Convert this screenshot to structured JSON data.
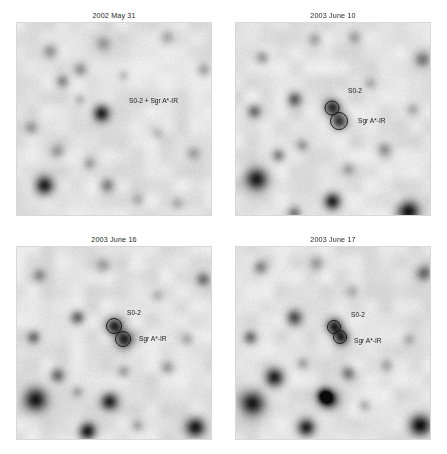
{
  "figure": {
    "name": "galactic-center-ir-epochs",
    "rows": 2,
    "columns": 2,
    "background_color": "#ffffff",
    "title_color": "#231f20",
    "label_color": "#1a1a1a",
    "frame_color": "#d8d8d8"
  },
  "panels": [
    {
      "id": "panel-1",
      "title": "2002 May 31",
      "labels": [
        {
          "text": "S0-2 + Sgr A*-IR",
          "x": 112,
          "y": 80
        }
      ],
      "markers": [],
      "sources": [
        {
          "x": 84,
          "y": 90,
          "r": 9.5,
          "depth": 0.88
        },
        {
          "x": 27,
          "y": 162,
          "r": 10.5,
          "depth": 0.92
        },
        {
          "x": 45,
          "y": 58,
          "r": 7.5,
          "depth": 0.4
        },
        {
          "x": 63,
          "y": 46,
          "r": 8.0,
          "depth": 0.34
        },
        {
          "x": 33,
          "y": 28,
          "r": 8.5,
          "depth": 0.33
        },
        {
          "x": 86,
          "y": 20,
          "r": 9.0,
          "depth": 0.3
        },
        {
          "x": 150,
          "y": 14,
          "r": 8.0,
          "depth": 0.26
        },
        {
          "x": 14,
          "y": 104,
          "r": 8.0,
          "depth": 0.36
        },
        {
          "x": 40,
          "y": 128,
          "r": 8.5,
          "depth": 0.34
        },
        {
          "x": 72,
          "y": 140,
          "r": 7.0,
          "depth": 0.26
        },
        {
          "x": 90,
          "y": 162,
          "r": 8.0,
          "depth": 0.36
        },
        {
          "x": 120,
          "y": 176,
          "r": 8.0,
          "depth": 0.28
        },
        {
          "x": 176,
          "y": 130,
          "r": 7.5,
          "depth": 0.24
        },
        {
          "x": 186,
          "y": 46,
          "r": 8.0,
          "depth": 0.3
        },
        {
          "x": 140,
          "y": 110,
          "r": 7.0,
          "depth": 0.18
        },
        {
          "x": 62,
          "y": 76,
          "r": 6.5,
          "depth": 0.22
        },
        {
          "x": 106,
          "y": 52,
          "r": 6.0,
          "depth": 0.16
        },
        {
          "x": 160,
          "y": 180,
          "r": 7.0,
          "depth": 0.2
        }
      ]
    },
    {
      "id": "panel-2",
      "title": "2003 June 10",
      "labels": [
        {
          "text": "S0-2",
          "x": 112,
          "y": 70
        },
        {
          "text": "Sgr A*-IR",
          "x": 122,
          "y": 100
        }
      ],
      "markers": [
        {
          "name": "S0-2",
          "x": 96,
          "y": 85,
          "r": 7
        },
        {
          "name": "Sgr A*-IR",
          "x": 103,
          "y": 98,
          "r": 8.5
        }
      ],
      "sources": [
        {
          "x": 96,
          "y": 84,
          "r": 9.0,
          "depth": 0.85
        },
        {
          "x": 103,
          "y": 98,
          "r": 9.0,
          "depth": 0.8
        },
        {
          "x": 20,
          "y": 156,
          "r": 13.0,
          "depth": 0.95
        },
        {
          "x": 96,
          "y": 178,
          "r": 9.5,
          "depth": 0.9
        },
        {
          "x": 172,
          "y": 188,
          "r": 12.0,
          "depth": 0.92
        },
        {
          "x": 58,
          "y": 76,
          "r": 8.0,
          "depth": 0.55
        },
        {
          "x": 18,
          "y": 88,
          "r": 8.0,
          "depth": 0.5
        },
        {
          "x": 42,
          "y": 132,
          "r": 7.5,
          "depth": 0.45
        },
        {
          "x": 26,
          "y": 34,
          "r": 7.5,
          "depth": 0.34
        },
        {
          "x": 78,
          "y": 16,
          "r": 8.0,
          "depth": 0.3
        },
        {
          "x": 118,
          "y": 14,
          "r": 7.5,
          "depth": 0.26
        },
        {
          "x": 186,
          "y": 36,
          "r": 8.5,
          "depth": 0.45
        },
        {
          "x": 148,
          "y": 126,
          "r": 8.0,
          "depth": 0.34
        },
        {
          "x": 112,
          "y": 146,
          "r": 7.5,
          "depth": 0.26
        },
        {
          "x": 66,
          "y": 122,
          "r": 7.0,
          "depth": 0.3
        },
        {
          "x": 58,
          "y": 190,
          "r": 8.0,
          "depth": 0.5
        },
        {
          "x": 176,
          "y": 86,
          "r": 7.0,
          "depth": 0.22
        },
        {
          "x": 134,
          "y": 60,
          "r": 6.5,
          "depth": 0.18
        }
      ]
    },
    {
      "id": "panel-3",
      "title": "2003 June 16",
      "labels": [
        {
          "text": "S0-2",
          "x": 110,
          "y": 68
        },
        {
          "text": "Sgr A*-IR",
          "x": 122,
          "y": 94
        }
      ],
      "markers": [
        {
          "name": "S0-2",
          "x": 97,
          "y": 79,
          "r": 7.5
        },
        {
          "name": "Sgr A*-IR",
          "x": 106,
          "y": 92,
          "r": 7.5
        }
      ],
      "sources": [
        {
          "x": 97,
          "y": 79,
          "r": 9.5,
          "depth": 0.85
        },
        {
          "x": 107,
          "y": 92,
          "r": 9.5,
          "depth": 0.88
        },
        {
          "x": 18,
          "y": 152,
          "r": 13.0,
          "depth": 0.95
        },
        {
          "x": 92,
          "y": 154,
          "r": 10.0,
          "depth": 0.9
        },
        {
          "x": 70,
          "y": 184,
          "r": 9.5,
          "depth": 0.92
        },
        {
          "x": 178,
          "y": 180,
          "r": 11.0,
          "depth": 0.92
        },
        {
          "x": 60,
          "y": 70,
          "r": 8.0,
          "depth": 0.58
        },
        {
          "x": 16,
          "y": 90,
          "r": 7.5,
          "depth": 0.48
        },
        {
          "x": 40,
          "y": 128,
          "r": 8.0,
          "depth": 0.5
        },
        {
          "x": 22,
          "y": 28,
          "r": 7.5,
          "depth": 0.34
        },
        {
          "x": 86,
          "y": 18,
          "r": 8.5,
          "depth": 0.3
        },
        {
          "x": 186,
          "y": 32,
          "r": 8.0,
          "depth": 0.48
        },
        {
          "x": 150,
          "y": 120,
          "r": 7.5,
          "depth": 0.3
        },
        {
          "x": 106,
          "y": 124,
          "r": 7.5,
          "depth": 0.3
        },
        {
          "x": 140,
          "y": 48,
          "r": 7.0,
          "depth": 0.2
        },
        {
          "x": 170,
          "y": 92,
          "r": 7.0,
          "depth": 0.22
        },
        {
          "x": 60,
          "y": 144,
          "r": 6.5,
          "depth": 0.22
        },
        {
          "x": 120,
          "y": 178,
          "r": 7.0,
          "depth": 0.24
        }
      ]
    },
    {
      "id": "panel-4",
      "title": "2003 June 17",
      "labels": [
        {
          "text": "S0-2",
          "x": 115,
          "y": 70
        },
        {
          "text": "Sgr A*-IR",
          "x": 118,
          "y": 96
        }
      ],
      "markers": [
        {
          "name": "S0-2",
          "x": 98,
          "y": 80,
          "r": 6.5
        },
        {
          "name": "Sgr A*-IR",
          "x": 104,
          "y": 90,
          "r": 6.5
        }
      ],
      "sources": [
        {
          "x": 98,
          "y": 79,
          "r": 9.0,
          "depth": 0.88
        },
        {
          "x": 105,
          "y": 90,
          "r": 8.5,
          "depth": 0.85
        },
        {
          "x": 16,
          "y": 156,
          "r": 14.0,
          "depth": 0.96
        },
        {
          "x": 38,
          "y": 130,
          "r": 10.5,
          "depth": 0.92
        },
        {
          "x": 92,
          "y": 152,
          "r": 10.5,
          "depth": 0.92
        },
        {
          "x": 88,
          "y": 148,
          "r": 8.0,
          "depth": 0.8
        },
        {
          "x": 70,
          "y": 180,
          "r": 10.0,
          "depth": 0.92
        },
        {
          "x": 184,
          "y": 178,
          "r": 12.0,
          "depth": 0.94
        },
        {
          "x": 58,
          "y": 70,
          "r": 9.0,
          "depth": 0.62
        },
        {
          "x": 14,
          "y": 90,
          "r": 8.0,
          "depth": 0.55
        },
        {
          "x": 24,
          "y": 20,
          "r": 8.0,
          "depth": 0.4
        },
        {
          "x": 80,
          "y": 16,
          "r": 8.5,
          "depth": 0.3
        },
        {
          "x": 116,
          "y": 44,
          "r": 8.0,
          "depth": 0.26
        },
        {
          "x": 188,
          "y": 26,
          "r": 9.0,
          "depth": 0.55
        },
        {
          "x": 150,
          "y": 118,
          "r": 7.5,
          "depth": 0.3
        },
        {
          "x": 112,
          "y": 126,
          "r": 8.0,
          "depth": 0.45
        },
        {
          "x": 66,
          "y": 116,
          "r": 7.0,
          "depth": 0.26
        },
        {
          "x": 128,
          "y": 158,
          "r": 7.0,
          "depth": 0.24
        },
        {
          "x": 172,
          "y": 92,
          "r": 7.0,
          "depth": 0.22
        }
      ]
    }
  ]
}
